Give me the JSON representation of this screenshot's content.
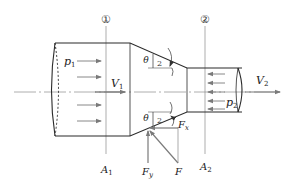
{
  "diagram": {
    "title": "",
    "sections": [
      {
        "id": "1",
        "marker": "①",
        "area_label": "A",
        "area_sub": "1"
      },
      {
        "id": "2",
        "marker": "②",
        "area_label": "A",
        "area_sub": "2"
      }
    ],
    "pressures": [
      {
        "label": "p",
        "sub": "1"
      },
      {
        "label": "p",
        "sub": "2"
      }
    ],
    "velocities": [
      {
        "label": "V",
        "sub": "1"
      },
      {
        "label": "V",
        "sub": "2"
      }
    ],
    "angle": {
      "symbol": "θ",
      "fraction_den": "2"
    },
    "forces": {
      "fx": {
        "label": "F",
        "sub": "x"
      },
      "fy": {
        "label": "F",
        "sub": "y"
      },
      "f": {
        "label": "F"
      }
    },
    "colors": {
      "outline": "#2a2a2a",
      "arrow": "#7a7a7a",
      "centerline": "#9a9a9a",
      "section_line": "#8a8a8a"
    }
  }
}
